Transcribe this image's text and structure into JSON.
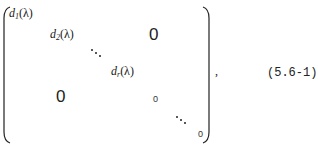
{
  "equation": {
    "entries": {
      "d1": {
        "base": "d",
        "sub": "1",
        "arg": "(λ)"
      },
      "d2": {
        "base": "d",
        "sub": "2",
        "arg": "(λ)"
      },
      "dr": {
        "base": "d",
        "sub": "r",
        "arg": "(λ)"
      }
    },
    "upper_zero": "0",
    "lower_zero": "0",
    "inner_zero": "0",
    "last_zero": "0",
    "trailing_comma": ",",
    "number": "(5.6-1)"
  }
}
